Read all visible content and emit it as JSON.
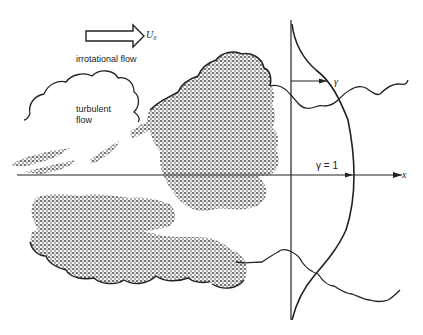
{
  "diagram": {
    "labels": {
      "free_stream_velocity": "U₀",
      "irrotational_flow": "irrotational flow",
      "turbulent_flow_line1": "turbulent",
      "turbulent_flow_line2": "flow",
      "gamma": "γ",
      "gamma_equals_one": "γ = 1",
      "x_axis": "x"
    },
    "colors": {
      "ink": "#222222",
      "background": "#ffffff",
      "stipple": "#333333"
    },
    "elements": {
      "flow_arrow": "hollow arrow pointing right indicating free-stream velocity U0",
      "centerline": "horizontal x-axis through center of turbulent region",
      "profile_axis": "vertical reference line at x approx 290",
      "intermittency_profile": "bell-shaped curve of intermittency factor gamma, reaching gamma = 1 at centerline",
      "turbulent_region": "stippled irregular region bounded by scalloped interface"
    }
  }
}
